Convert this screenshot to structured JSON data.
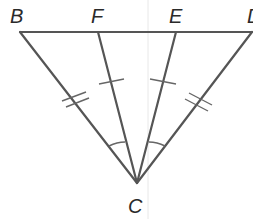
{
  "diagram": {
    "type": "geometry-triangle",
    "points": {
      "B": {
        "label": "B",
        "x": 20,
        "y": 32
      },
      "F": {
        "label": "F",
        "x": 98,
        "y": 32
      },
      "E": {
        "label": "E",
        "x": 176,
        "y": 32
      },
      "D": {
        "label": "D",
        "x": 252,
        "y": 32
      },
      "C": {
        "label": "C",
        "x": 137,
        "y": 183
      }
    },
    "labels": {
      "B": "B",
      "F": "F",
      "E": "E",
      "D": "D",
      "C": "C"
    },
    "segments": [
      {
        "from": "B",
        "to": "D"
      },
      {
        "from": "B",
        "to": "C"
      },
      {
        "from": "F",
        "to": "C"
      },
      {
        "from": "E",
        "to": "C"
      },
      {
        "from": "D",
        "to": "C"
      }
    ],
    "congruence_marks": [
      {
        "segment": "BC",
        "ticks": 2
      },
      {
        "segment": "DC",
        "ticks": 2
      },
      {
        "segment": "FC",
        "ticks": 1
      },
      {
        "segment": "EC",
        "ticks": 1
      }
    ],
    "angle_marks": [
      {
        "angle": "BCF",
        "arcs": 1
      },
      {
        "angle": "ECD",
        "arcs": 1
      }
    ],
    "colors": {
      "line": "#555555",
      "label": "#2a2a2a",
      "background": "#ffffff"
    }
  }
}
